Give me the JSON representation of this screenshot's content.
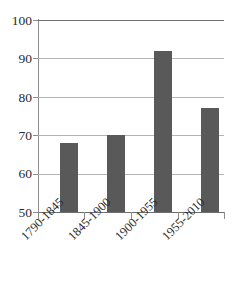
{
  "chart_data": {
    "type": "bar",
    "title": "",
    "subtitle": "",
    "xlabel": "",
    "ylabel": "",
    "categories": [
      "1790-1845",
      "1845-1900",
      "1900-1955",
      "1955-2010"
    ],
    "values": [
      68,
      70,
      92,
      77
    ],
    "ylim": [
      50,
      100
    ],
    "yticks": [
      50,
      60,
      70,
      80,
      90,
      100
    ],
    "ytick_labels": [
      "50",
      "60",
      "70",
      "80",
      "90",
      "100"
    ],
    "grid": "horizontal",
    "legend": "none",
    "series": [
      {
        "name": "",
        "values": [
          68,
          70,
          92,
          77
        ]
      }
    ],
    "colors": {
      "bar_fill": "#595959",
      "gridline": "#b4b4b4",
      "axis_line": "#8c8c8c",
      "frame_line": "#6e6e6e",
      "text": "#2b2b2b",
      "background": "#ffffff"
    }
  }
}
